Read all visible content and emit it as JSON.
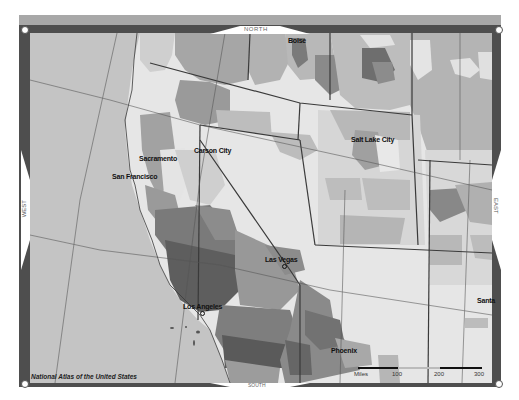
{
  "map": {
    "title_credit": "National Atlas of the United States",
    "compass": {
      "north": "NORTH",
      "south": "SOUTH",
      "east": "EAST",
      "west": "WEST"
    },
    "cities": [
      {
        "name": "Boise",
        "x": 288,
        "y": 39
      },
      {
        "name": "Carson City",
        "x": 194,
        "y": 148
      },
      {
        "name": "Sacramento",
        "x": 139,
        "y": 155
      },
      {
        "name": "San Francisco",
        "x": 112,
        "y": 174
      },
      {
        "name": "Salt Lake City",
        "x": 351,
        "y": 137
      },
      {
        "name": "Las Vegas",
        "x": 265,
        "y": 258
      },
      {
        "name": "Los Angeles",
        "x": 183,
        "y": 303
      },
      {
        "name": "Phoenix",
        "x": 331,
        "y": 348
      },
      {
        "name": "Santa",
        "x": 477,
        "y": 298
      }
    ],
    "scale": {
      "unit": "Miles",
      "ticks": [
        "100",
        "200",
        "300"
      ]
    },
    "colors": {
      "frame_dark": "#4e4e4e",
      "frame_light": "#a8a8a8",
      "ocean": "#c4c4c4",
      "land_light": "#e6e6e6",
      "land_mid": "#b8b8b8",
      "land_dark": "#8a8a8a",
      "land_darker": "#6e6e6e",
      "land_darkest": "#555555",
      "border": "#3a3a3a"
    }
  }
}
